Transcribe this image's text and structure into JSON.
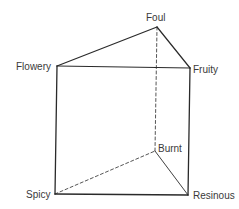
{
  "diagram": {
    "type": "triangular-prism",
    "vertices": [
      {
        "id": "foul",
        "label": "Foul",
        "x": 157,
        "y": 27,
        "label_x": 146,
        "label_y": 12
      },
      {
        "id": "flowery",
        "label": "Flowery",
        "x": 57,
        "y": 66,
        "label_x": 16,
        "label_y": 61
      },
      {
        "id": "fruity",
        "label": "Fruity",
        "x": 190,
        "y": 68,
        "label_x": 193,
        "label_y": 64
      },
      {
        "id": "burnt",
        "label": "Burnt",
        "x": 155,
        "y": 151,
        "label_x": 158,
        "label_y": 143
      },
      {
        "id": "spicy",
        "label": "Spicy",
        "x": 55,
        "y": 194,
        "label_x": 26,
        "label_y": 189
      },
      {
        "id": "resinous",
        "label": "Resinous",
        "x": 187,
        "y": 195,
        "label_x": 193,
        "label_y": 190
      }
    ],
    "edges": [
      {
        "from": "foul",
        "to": "flowery",
        "style": "solid"
      },
      {
        "from": "foul",
        "to": "fruity",
        "style": "solid"
      },
      {
        "from": "flowery",
        "to": "fruity",
        "style": "solid"
      },
      {
        "from": "flowery",
        "to": "spicy",
        "style": "solid"
      },
      {
        "from": "fruity",
        "to": "resinous",
        "style": "solid"
      },
      {
        "from": "spicy",
        "to": "resinous",
        "style": "solid"
      },
      {
        "from": "burnt",
        "to": "resinous",
        "style": "solid-thin"
      },
      {
        "from": "foul",
        "to": "burnt",
        "style": "dashed"
      },
      {
        "from": "spicy",
        "to": "burnt",
        "style": "dashed"
      }
    ],
    "colors": {
      "line": "#2a2a2a",
      "text": "#3a3a3a",
      "background": "#ffffff"
    }
  }
}
